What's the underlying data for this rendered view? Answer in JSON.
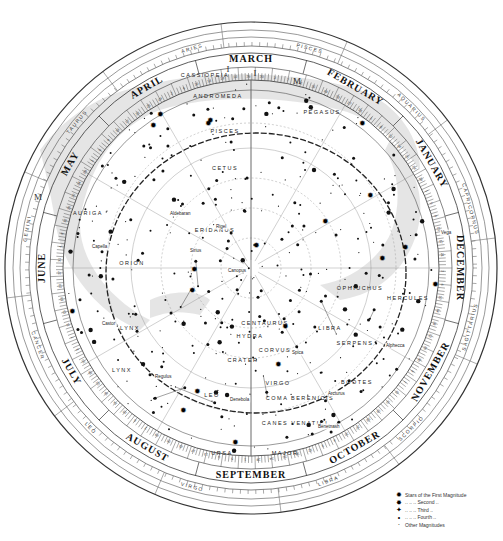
{
  "chart": {
    "type": "planisphere-star-chart",
    "center": [
      251,
      268
    ],
    "months": [
      {
        "label": "MARCH",
        "angle": -90
      },
      {
        "label": "FEBRUARY",
        "angle": -60
      },
      {
        "label": "JANUARY",
        "angle": -30
      },
      {
        "label": "DECEMBER",
        "angle": 0
      },
      {
        "label": "NOVEMBER",
        "angle": 30
      },
      {
        "label": "OCTOBER",
        "angle": 60
      },
      {
        "label": "SEPTEMBER",
        "angle": 90
      },
      {
        "label": "AUGUST",
        "angle": 120
      },
      {
        "label": "JULY",
        "angle": 150
      },
      {
        "label": "JUNE",
        "angle": 180
      },
      {
        "label": "MAY",
        "angle": 210
      },
      {
        "label": "APRIL",
        "angle": 240
      }
    ],
    "zodiac": [
      {
        "label": "PISCES",
        "angle": -75
      },
      {
        "label": "ARIES",
        "angle": -105
      },
      {
        "label": "AQUARIUS",
        "angle": -45
      },
      {
        "label": "CAPRICORNUS",
        "angle": -15
      },
      {
        "label": "SAGITTARIUS",
        "angle": 15
      },
      {
        "label": "SCORPIO",
        "angle": 45
      },
      {
        "label": "LIBRA",
        "angle": 70
      },
      {
        "label": "VIRGO",
        "angle": 105
      },
      {
        "label": "LEO",
        "angle": 135
      },
      {
        "label": "CANCER",
        "angle": 160
      },
      {
        "label": "GEMINI",
        "angle": 190
      },
      {
        "label": "TAURUS",
        "angle": 220
      }
    ],
    "constellations": [
      {
        "label": "CASSIOPEIA",
        "x": 205,
        "y": 77
      },
      {
        "label": "ANDROMEDA",
        "x": 218,
        "y": 98
      },
      {
        "label": "PEGASUS",
        "x": 322,
        "y": 114
      },
      {
        "label": "PISCES",
        "x": 225,
        "y": 133
      },
      {
        "label": "CETUS",
        "x": 225,
        "y": 170
      },
      {
        "label": "ERIDANUS",
        "x": 215,
        "y": 232
      },
      {
        "label": "CENTAURUS",
        "x": 265,
        "y": 325
      },
      {
        "label": "HYDRA",
        "x": 250,
        "y": 338
      },
      {
        "label": "CORVUS",
        "x": 275,
        "y": 352
      },
      {
        "label": "CRATER",
        "x": 243,
        "y": 362
      },
      {
        "label": "VIRGO",
        "x": 278,
        "y": 385
      },
      {
        "label": "LEO",
        "x": 212,
        "y": 397
      },
      {
        "label": "COMA BERENICIS",
        "x": 300,
        "y": 400
      },
      {
        "label": "CANES VENATICI",
        "x": 295,
        "y": 425
      },
      {
        "label": "URSA",
        "x": 222,
        "y": 455
      },
      {
        "label": "MAJOR",
        "x": 285,
        "y": 455
      },
      {
        "label": "LYNX",
        "x": 130,
        "y": 330
      },
      {
        "label": "LYNX",
        "x": 122,
        "y": 372
      },
      {
        "label": "SERPENS",
        "x": 355,
        "y": 345
      },
      {
        "label": "BOOTES",
        "x": 357,
        "y": 384
      },
      {
        "label": "HERCULES",
        "x": 408,
        "y": 300
      },
      {
        "label": "OPHIUCHUS",
        "x": 360,
        "y": 290
      },
      {
        "label": "LIBRA",
        "x": 330,
        "y": 330
      },
      {
        "label": "AURIGA",
        "x": 88,
        "y": 215
      },
      {
        "label": "ORION",
        "x": 132,
        "y": 265
      }
    ],
    "star_names": [
      {
        "label": "Capella",
        "x": 92,
        "y": 248
      },
      {
        "label": "Castor",
        "x": 102,
        "y": 325
      },
      {
        "label": "Regulus",
        "x": 155,
        "y": 378
      },
      {
        "label": "Denebola",
        "x": 230,
        "y": 401
      },
      {
        "label": "Spica",
        "x": 292,
        "y": 354
      },
      {
        "label": "Arcturus",
        "x": 328,
        "y": 395
      },
      {
        "label": "Alphecca",
        "x": 386,
        "y": 347
      },
      {
        "label": "Benetnash",
        "x": 318,
        "y": 428
      },
      {
        "label": "Sirius",
        "x": 190,
        "y": 252
      },
      {
        "label": "Rigel",
        "x": 216,
        "y": 228
      },
      {
        "label": "Aldebaran",
        "x": 170,
        "y": 215
      },
      {
        "label": "Vega",
        "x": 441,
        "y": 234
      },
      {
        "label": "Canopus",
        "x": 228,
        "y": 272
      }
    ],
    "milky_way_labels": [
      {
        "label": "M",
        "x": 38,
        "y": 200
      },
      {
        "label": "I",
        "x": 228,
        "y": 72
      },
      {
        "label": "I",
        "x": 255,
        "y": 76
      },
      {
        "label": "M",
        "x": 297,
        "y": 84
      }
    ]
  },
  "legend": {
    "items": [
      {
        "symbol": "✹",
        "label": "Stars of the First Magnitude"
      },
      {
        "symbol": "✸",
        "label": "  ..    ..    ..   Second    .."
      },
      {
        "symbol": "✦",
        "label": "  ..    ..    ..   Third      .."
      },
      {
        "symbol": "•",
        "label": "  ..    ..    ..   Fourth     .."
      },
      {
        "symbol": "·",
        "label": "Other Magnitudes"
      }
    ]
  }
}
